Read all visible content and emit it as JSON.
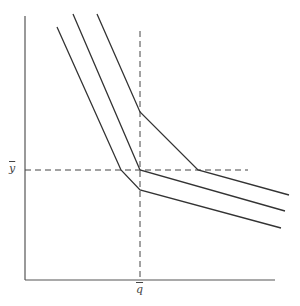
{
  "diagram": {
    "type": "isoquant-kinked",
    "labels": {
      "y_bar": "y",
      "q_bar": "q"
    },
    "axes": {
      "y_axis": {
        "x": 25,
        "y_top": 16,
        "y_bottom": 280
      },
      "x_axis": {
        "y": 280,
        "x_left": 25,
        "x_right": 275
      }
    },
    "reference_lines": {
      "horizontal_y_bar": {
        "y": 170,
        "x_start": 25,
        "x_end": 248
      },
      "vertical_q_bar": {
        "x": 140,
        "y_start": 31,
        "y_end": 280
      }
    },
    "curves": [
      {
        "name": "outer",
        "points": [
          [
            97,
            14
          ],
          [
            140,
            112
          ],
          [
            198,
            170
          ],
          [
            289,
            195
          ]
        ]
      },
      {
        "name": "middle",
        "points": [
          [
            73,
            14
          ],
          [
            140,
            170
          ],
          [
            285,
            211
          ]
        ]
      },
      {
        "name": "inner",
        "points": [
          [
            57,
            27
          ],
          [
            121,
            170
          ],
          [
            140,
            190
          ],
          [
            281,
            228
          ]
        ]
      }
    ],
    "colors": {
      "line": "#333333",
      "axis": "#555555",
      "background": "#ffffff"
    }
  }
}
